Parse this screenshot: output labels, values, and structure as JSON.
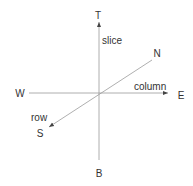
{
  "diagram": {
    "type": "3d-axis-orientation",
    "directions": {
      "top": "T",
      "bottom": "B",
      "west": "W",
      "east": "E",
      "north": "N",
      "south": "S"
    },
    "axes": {
      "vertical": "slice",
      "horizontal": "column",
      "depth": "row"
    },
    "colors": {
      "line": "#9a9a9a",
      "text": "#333333",
      "arrow": "#444444"
    }
  }
}
